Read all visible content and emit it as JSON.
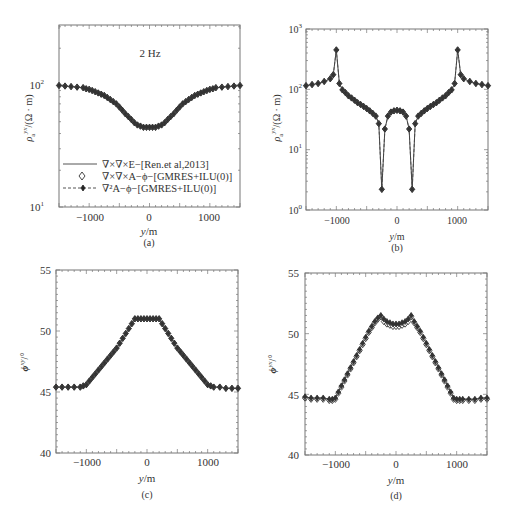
{
  "chart_data": [
    {
      "id": "a",
      "type": "line",
      "caption": "(a)",
      "annotation": "2 Hz",
      "xlabel": "y/m",
      "ylabel": "ρa^yx/(Ω·m)",
      "yscale": "log",
      "xlim": [
        -1500,
        1500
      ],
      "ylim": [
        10,
        310
      ],
      "xticks": [
        -1000,
        0,
        1000
      ],
      "xtick_labels": [
        "-1000",
        "0",
        "1000"
      ],
      "yticks": [
        10,
        100
      ],
      "ytick_labels": [
        "10^1",
        "10^2"
      ],
      "box": {
        "left": 59,
        "top": 25,
        "right": 240,
        "bottom": 207
      },
      "legend": [
        {
          "label": "∇×∇×E−[Ren.et al,2013]",
          "style": "solid-line"
        },
        {
          "label": "∇×∇×A−ϕ−[GMRES+ILU(0)]",
          "style": "open-diamond"
        },
        {
          "label": "∇²A−ϕ−[GMRES+ILU(0)]",
          "style": "dashed-line-star"
        }
      ],
      "x": [
        -1500,
        -1400,
        -1300,
        -1200,
        -1100,
        -1050,
        -1000,
        -950,
        -900,
        -850,
        -800,
        -750,
        -700,
        -650,
        -600,
        -550,
        -500,
        -450,
        -400,
        -350,
        -300,
        -250,
        -200,
        -150,
        -100,
        -50,
        0,
        50,
        100,
        150,
        200,
        250,
        300,
        350,
        400,
        450,
        500,
        550,
        600,
        650,
        700,
        750,
        800,
        850,
        900,
        950,
        1000,
        1050,
        1100,
        1200,
        1300,
        1400,
        1500
      ],
      "series": [
        {
          "name": "∇×∇×E−[Ren.et al,2013]",
          "values": [
            99,
            98,
            97,
            96,
            95,
            93,
            92,
            90,
            88,
            86,
            84,
            82,
            79,
            76,
            73,
            70,
            66,
            62,
            58,
            55,
            52,
            49,
            47,
            46,
            45,
            45,
            45,
            45,
            45,
            46,
            47,
            49,
            52,
            55,
            58,
            62,
            66,
            70,
            73,
            76,
            79,
            82,
            84,
            86,
            88,
            90,
            92,
            93,
            95,
            96,
            97,
            98,
            99
          ]
        },
        {
          "name": "∇×∇×A−ϕ−[GMRES+ILU(0)]",
          "values": [
            99,
            98,
            97,
            96,
            95,
            93,
            92,
            90,
            88,
            86,
            84,
            82,
            79,
            76,
            73,
            70,
            66,
            62,
            58,
            55,
            52,
            49,
            47,
            46,
            45,
            45,
            45,
            45,
            45,
            46,
            47,
            49,
            52,
            55,
            58,
            62,
            66,
            70,
            73,
            76,
            79,
            82,
            84,
            86,
            88,
            90,
            92,
            93,
            95,
            96,
            97,
            98,
            99
          ]
        },
        {
          "name": "∇²A−ϕ−[GMRES+ILU(0)]",
          "values": [
            99,
            98,
            97,
            96,
            95,
            93,
            92,
            90,
            88,
            86,
            84,
            82,
            79,
            76,
            73,
            70,
            66,
            62,
            58,
            55,
            52,
            49,
            47,
            46,
            45,
            45,
            45,
            45,
            45,
            46,
            47,
            49,
            52,
            55,
            58,
            62,
            66,
            70,
            73,
            76,
            79,
            82,
            84,
            86,
            88,
            90,
            92,
            93,
            95,
            96,
            97,
            98,
            99
          ]
        }
      ]
    },
    {
      "id": "b",
      "type": "line",
      "caption": "(b)",
      "xlabel": "y/m",
      "ylabel": "ρa^yx/(Ω·m)",
      "yscale": "log",
      "xlim": [
        -1500,
        1500
      ],
      "ylim": [
        1,
        1000
      ],
      "xticks": [
        -1000,
        0,
        1000
      ],
      "xtick_labels": [
        "-1000",
        "0",
        "1000"
      ],
      "yticks": [
        1,
        10,
        100,
        1000
      ],
      "ytick_labels": [
        "10^0",
        "10^1",
        "10^2",
        "10^3"
      ],
      "box": {
        "left": 306,
        "top": 29,
        "right": 488,
        "bottom": 210
      },
      "x": [
        -1500,
        -1400,
        -1300,
        -1200,
        -1100,
        -1050,
        -1000,
        -950,
        -900,
        -850,
        -800,
        -750,
        -700,
        -650,
        -600,
        -550,
        -500,
        -450,
        -400,
        -350,
        -300,
        -250,
        -200,
        -150,
        -100,
        -50,
        0,
        50,
        100,
        150,
        200,
        250,
        300,
        350,
        400,
        450,
        500,
        550,
        600,
        650,
        700,
        750,
        800,
        850,
        900,
        950,
        1000,
        1050,
        1100,
        1200,
        1300,
        1400,
        1500
      ],
      "series": [
        {
          "name": "∇×∇×E−[Ren.et al,2013]",
          "values": [
            115,
            120,
            125,
            135,
            150,
            175,
            450,
            125,
            98,
            88,
            78,
            72,
            66,
            60,
            56,
            52,
            48,
            44,
            40,
            36,
            27,
            2.2,
            22,
            36,
            42,
            44,
            45,
            44,
            42,
            36,
            22,
            2.2,
            27,
            36,
            40,
            44,
            48,
            52,
            56,
            60,
            66,
            72,
            78,
            88,
            98,
            125,
            450,
            175,
            150,
            135,
            125,
            120,
            115
          ]
        },
        {
          "name": "∇×∇×A−ϕ−[GMRES+ILU(0)]",
          "values": [
            115,
            120,
            125,
            135,
            150,
            175,
            450,
            125,
            98,
            88,
            78,
            72,
            66,
            60,
            56,
            52,
            48,
            44,
            40,
            36,
            27,
            2.2,
            22,
            36,
            42,
            44,
            45,
            44,
            42,
            36,
            22,
            2.2,
            27,
            36,
            40,
            44,
            48,
            52,
            56,
            60,
            66,
            72,
            78,
            88,
            98,
            125,
            450,
            175,
            150,
            135,
            125,
            120,
            115
          ]
        },
        {
          "name": "∇²A−ϕ−[GMRES+ILU(0)]",
          "values": [
            115,
            120,
            125,
            135,
            150,
            175,
            450,
            125,
            98,
            88,
            78,
            72,
            66,
            60,
            56,
            52,
            48,
            44,
            40,
            36,
            27,
            2.2,
            22,
            36,
            42,
            44,
            45,
            44,
            42,
            36,
            22,
            2.2,
            27,
            36,
            40,
            44,
            48,
            52,
            56,
            60,
            66,
            72,
            78,
            88,
            98,
            125,
            450,
            175,
            150,
            135,
            125,
            120,
            115
          ]
        }
      ]
    },
    {
      "id": "c",
      "type": "line",
      "caption": "(c)",
      "xlabel": "y/m",
      "ylabel": "ϕ^xy/°",
      "yscale": "linear",
      "xlim": [
        -1500,
        1500
      ],
      "ylim": [
        40,
        55
      ],
      "xticks": [
        -1000,
        0,
        1000
      ],
      "xtick_labels": [
        "-1000",
        "0",
        "1000"
      ],
      "yticks": [
        40,
        45,
        50,
        55
      ],
      "ytick_labels": [
        "40",
        "45",
        "50",
        "55"
      ],
      "box": {
        "left": 56,
        "top": 270,
        "right": 238,
        "bottom": 453
      },
      "x": [
        -1500,
        -1400,
        -1300,
        -1200,
        -1100,
        -1050,
        -1000,
        -950,
        -900,
        -850,
        -800,
        -750,
        -700,
        -650,
        -600,
        -550,
        -500,
        -450,
        -400,
        -350,
        -300,
        -250,
        -200,
        -150,
        -100,
        -50,
        0,
        50,
        100,
        150,
        200,
        250,
        300,
        350,
        400,
        450,
        500,
        550,
        600,
        650,
        700,
        750,
        800,
        850,
        900,
        950,
        1000,
        1050,
        1100,
        1200,
        1300,
        1400,
        1500
      ],
      "series": [
        {
          "name": "∇×∇×E−[Ren.et al,2013]",
          "values": [
            45.4,
            45.4,
            45.4,
            45.4,
            45.4,
            45.5,
            45.6,
            45.9,
            46.2,
            46.5,
            46.8,
            47.1,
            47.4,
            47.7,
            48.0,
            48.3,
            48.6,
            49.0,
            49.4,
            49.8,
            50.2,
            50.6,
            51.0,
            51.0,
            51.0,
            51.0,
            51.0,
            51.0,
            51.0,
            51.0,
            51.0,
            50.6,
            50.2,
            49.8,
            49.4,
            49.0,
            48.6,
            48.3,
            48.0,
            47.7,
            47.4,
            47.1,
            46.8,
            46.5,
            46.2,
            45.9,
            45.6,
            45.5,
            45.4,
            45.4,
            45.3,
            45.3,
            45.3
          ]
        },
        {
          "name": "∇×∇×A−ϕ−[GMRES+ILU(0)]",
          "values": [
            45.4,
            45.4,
            45.4,
            45.4,
            45.4,
            45.5,
            45.6,
            45.9,
            46.2,
            46.5,
            46.8,
            47.1,
            47.4,
            47.7,
            48.0,
            48.3,
            48.6,
            49.0,
            49.4,
            49.8,
            50.2,
            50.6,
            51.0,
            51.0,
            51.0,
            51.0,
            51.0,
            51.0,
            51.0,
            51.0,
            51.0,
            50.6,
            50.2,
            49.8,
            49.4,
            49.0,
            48.6,
            48.3,
            48.0,
            47.7,
            47.4,
            47.1,
            46.8,
            46.5,
            46.2,
            45.9,
            45.6,
            45.5,
            45.4,
            45.4,
            45.3,
            45.3,
            45.3
          ]
        },
        {
          "name": "∇²A−ϕ−[GMRES+ILU(0)]",
          "values": [
            45.4,
            45.4,
            45.4,
            45.4,
            45.4,
            45.5,
            45.6,
            45.9,
            46.2,
            46.5,
            46.8,
            47.1,
            47.4,
            47.7,
            48.0,
            48.3,
            48.6,
            49.0,
            49.4,
            49.8,
            50.2,
            50.6,
            51.0,
            51.0,
            51.0,
            51.0,
            51.0,
            51.0,
            51.0,
            51.0,
            51.0,
            50.6,
            50.2,
            49.8,
            49.4,
            49.0,
            48.6,
            48.3,
            48.0,
            47.7,
            47.4,
            47.1,
            46.8,
            46.5,
            46.2,
            45.9,
            45.6,
            45.5,
            45.4,
            45.4,
            45.3,
            45.3,
            45.3
          ]
        }
      ]
    },
    {
      "id": "d",
      "type": "line",
      "caption": "(d)",
      "xlabel": "y/m",
      "ylabel": "ϕ^yx/°",
      "yscale": "linear",
      "xlim": [
        -1500,
        1500
      ],
      "ylim": [
        40,
        55
      ],
      "xticks": [
        -1000,
        0,
        1000
      ],
      "xtick_labels": [
        "-1000",
        "0",
        "1000"
      ],
      "yticks": [
        40,
        45,
        50,
        55
      ],
      "ytick_labels": [
        "40",
        "45",
        "50",
        "55"
      ],
      "box": {
        "left": 305,
        "top": 273,
        "right": 487,
        "bottom": 455
      },
      "x": [
        -1500,
        -1400,
        -1300,
        -1200,
        -1100,
        -1050,
        -1000,
        -950,
        -900,
        -850,
        -800,
        -750,
        -700,
        -650,
        -600,
        -550,
        -500,
        -450,
        -400,
        -350,
        -300,
        -250,
        -200,
        -150,
        -100,
        -50,
        0,
        50,
        100,
        150,
        200,
        250,
        300,
        350,
        400,
        450,
        500,
        550,
        600,
        650,
        700,
        750,
        800,
        850,
        900,
        950,
        1000,
        1050,
        1100,
        1200,
        1300,
        1400,
        1500
      ],
      "series": [
        {
          "name": "∇×∇×E−[Ren.et al,2013]",
          "values": [
            44.8,
            44.7,
            44.7,
            44.7,
            44.6,
            44.6,
            44.7,
            45.2,
            45.7,
            46.2,
            46.7,
            47.2,
            47.7,
            48.2,
            48.7,
            49.2,
            49.7,
            50.2,
            50.6,
            51.0,
            51.3,
            51.5,
            51.2,
            51.0,
            50.9,
            50.8,
            50.8,
            50.8,
            50.9,
            51.0,
            51.2,
            51.5,
            51.0,
            50.6,
            50.2,
            49.7,
            49.2,
            48.7,
            48.2,
            47.7,
            47.2,
            46.7,
            46.2,
            45.7,
            45.2,
            44.7,
            44.6,
            44.6,
            44.6,
            44.6,
            44.6,
            44.7,
            44.7
          ]
        },
        {
          "name": "∇×∇×A−ϕ−[GMRES+ILU(0)]",
          "values": [
            44.7,
            44.6,
            44.6,
            44.6,
            44.5,
            44.5,
            44.6,
            45.1,
            45.6,
            46.1,
            46.6,
            47.1,
            47.6,
            48.1,
            48.6,
            49.1,
            49.6,
            50.1,
            50.5,
            50.9,
            51.2,
            51.4,
            51.0,
            50.8,
            50.7,
            50.6,
            50.6,
            50.6,
            50.7,
            50.8,
            51.0,
            51.4,
            50.9,
            50.5,
            50.1,
            49.6,
            49.1,
            48.6,
            48.1,
            47.6,
            47.1,
            46.6,
            46.1,
            45.6,
            45.1,
            44.6,
            44.5,
            44.5,
            44.5,
            44.5,
            44.5,
            44.6,
            44.6
          ]
        },
        {
          "name": "∇²A−ϕ−[GMRES+ILU(0)]",
          "values": [
            44.8,
            44.7,
            44.7,
            44.7,
            44.6,
            44.6,
            44.7,
            45.2,
            45.7,
            46.2,
            46.7,
            47.2,
            47.7,
            48.2,
            48.7,
            49.2,
            49.7,
            50.2,
            50.6,
            51.0,
            51.3,
            51.5,
            51.2,
            51.0,
            50.9,
            50.8,
            50.8,
            50.8,
            50.9,
            51.0,
            51.2,
            51.5,
            51.0,
            50.6,
            50.2,
            49.7,
            49.2,
            48.7,
            48.2,
            47.7,
            47.2,
            46.7,
            46.2,
            45.7,
            45.2,
            44.7,
            44.6,
            44.6,
            44.6,
            44.6,
            44.6,
            44.7,
            44.7
          ]
        }
      ]
    }
  ],
  "labels": {
    "a": {
      "caption": "(a)",
      "annotation": "2 Hz",
      "xlabel_var": "y",
      "xlabel_unit": "/m",
      "ylabel_var": "ρ",
      "ylabel_sub": "a",
      "ylabel_sup": "yx",
      "ylabel_unit": "/(Ω · m)",
      "ytick_1": "10",
      "ytick_1_exp": "1",
      "ytick_2": "10",
      "ytick_2_exp": "2",
      "xtick_1": "−1000",
      "xtick_2": "0",
      "xtick_3": "1000",
      "legend_1": "∇×∇×E−[Ren.et al,2013]",
      "legend_2": "∇×∇×A−ϕ−[GMRES+ILU(0)]",
      "legend_3": "∇²A−ϕ−[GMRES+ILU(0)]"
    },
    "b": {
      "caption": "(b)",
      "xlabel_var": "y",
      "xlabel_unit": "/m",
      "ylabel_var": "ρ",
      "ylabel_sub": "a",
      "ylabel_sup": "yx",
      "ylabel_unit": "/(Ω · m)",
      "ytick_0": "10",
      "ytick_0_exp": "0",
      "ytick_1": "10",
      "ytick_1_exp": "1",
      "ytick_2": "10",
      "ytick_2_exp": "2",
      "ytick_3": "10",
      "ytick_3_exp": "3",
      "xtick_1": "−1000",
      "xtick_2": "0",
      "xtick_3": "1000"
    },
    "c": {
      "caption": "(c)",
      "xlabel_var": "y",
      "xlabel_unit": "/m",
      "ylabel": "ϕ",
      "ylabel_sup": "xy",
      "ylabel_unit": "/°",
      "ytick_40": "40",
      "ytick_45": "45",
      "ytick_50": "50",
      "ytick_55": "55",
      "xtick_1": "−1000",
      "xtick_2": "0",
      "xtick_3": "1000"
    },
    "d": {
      "caption": "(d)",
      "xlabel_var": "y",
      "xlabel_unit": "/m",
      "ylabel": "ϕ",
      "ylabel_sup": "yx",
      "ylabel_unit": "/°",
      "ytick_40": "40",
      "ytick_45": "45",
      "ytick_50": "50",
      "ytick_55": "55",
      "xtick_1": "−1000",
      "xtick_2": "0",
      "xtick_3": "1000"
    }
  },
  "colors": {
    "line": "#444444",
    "marker": "#333333",
    "axis": "#666666",
    "text": "#333333"
  }
}
